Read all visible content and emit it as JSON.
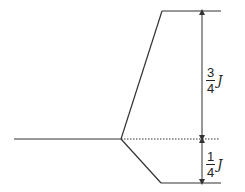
{
  "diagram": {
    "upper_label": {
      "numerator": "3",
      "denominator": "4",
      "symbol": "J"
    },
    "lower_label": {
      "numerator": "1",
      "denominator": "4",
      "symbol": "J"
    },
    "colors": {
      "line": "#333333"
    }
  }
}
